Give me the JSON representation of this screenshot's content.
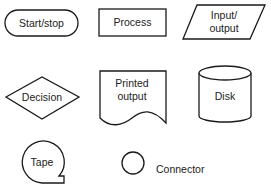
{
  "diagram": {
    "type": "flowchart-symbol-legend",
    "symbols": [
      {
        "id": "start-stop",
        "label": "Start/stop",
        "shape": "terminator"
      },
      {
        "id": "process",
        "label": "Process",
        "shape": "rectangle"
      },
      {
        "id": "input-output",
        "label_lines": [
          "Input/",
          "output"
        ],
        "shape": "parallelogram"
      },
      {
        "id": "decision",
        "label": "Decision",
        "shape": "diamond"
      },
      {
        "id": "printed-output",
        "label_lines": [
          "Printed",
          "output"
        ],
        "shape": "document"
      },
      {
        "id": "disk",
        "label": "Disk",
        "shape": "cylinder"
      },
      {
        "id": "tape",
        "label": "Tape",
        "shape": "tape"
      },
      {
        "id": "connector",
        "label": "Connector",
        "shape": "circle"
      }
    ],
    "colors": {
      "stroke": "#1a1a1a",
      "fill": "#ffffff",
      "text": "#222222"
    }
  }
}
